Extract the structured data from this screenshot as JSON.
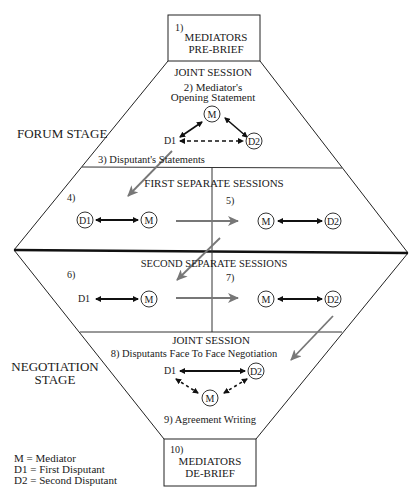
{
  "diagram": {
    "top_box": {
      "number": "1)",
      "line1": "MEDIATORS",
      "line2": "PRE-BRIEF"
    },
    "bottom_box": {
      "number": "10)",
      "line1": "MEDIATORS",
      "line2": "DE-BRIEF"
    },
    "stages": {
      "forum": "FORUM STAGE",
      "negotiation_line1": "NEGOTIATION",
      "negotiation_line2": "STAGE"
    },
    "joint_session_1": {
      "title": "JOINT SESSION",
      "step_line1": "2) Mediator's",
      "step_line2": "Opening Statement",
      "step3": "3) Disputant's Statements",
      "nodes": {
        "m": "M",
        "d1": "D1",
        "d2": "D2"
      }
    },
    "first_separate": {
      "title": "FIRST SEPARATE SESSIONS",
      "left_num": "4)",
      "right_num": "5)",
      "nodes": {
        "d1": "D1",
        "m_left": "M",
        "m_right": "M",
        "d2": "D2"
      }
    },
    "second_separate": {
      "title": "SECOND SEPARATE SESSIONS",
      "left_num": "6)",
      "right_num": "7)",
      "nodes": {
        "d1": "D1",
        "m_left": "M",
        "m_right": "M",
        "d2": "D2"
      }
    },
    "joint_session_2": {
      "title": "JOINT SESSION",
      "step8": "8) Disputants Face To Face Negotiation",
      "step9": "9) Agreement Writing",
      "nodes": {
        "d1": "D1",
        "d2": "D2",
        "m": "M"
      }
    },
    "legend": {
      "items": [
        "M = Mediator",
        "D1 = First Disputant",
        "D2 = Second Disputant"
      ]
    },
    "colors": {
      "line": "#1a1a1a",
      "flow_arrow": "#777777"
    }
  }
}
